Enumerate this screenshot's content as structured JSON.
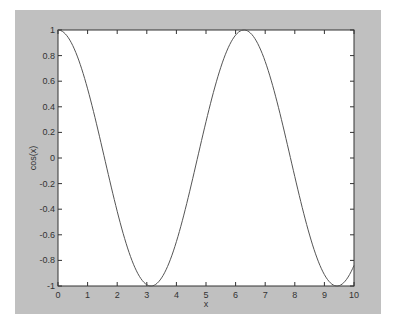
{
  "chart_data": {
    "type": "line",
    "title": "",
    "xlabel": "x",
    "ylabel": "cos(x)",
    "xlim": [
      0,
      10
    ],
    "ylim": [
      -1,
      1
    ],
    "grid": false,
    "legend": null,
    "x_ticks": [
      "0",
      "1",
      "2",
      "3",
      "4",
      "5",
      "6",
      "7",
      "8",
      "9",
      "10"
    ],
    "y_ticks": [
      "1",
      "0.8",
      "0.6",
      "0.4",
      "0.2",
      "0",
      "-0.2",
      "-0.4",
      "-0.6",
      "-0.8",
      "-1"
    ],
    "series": [
      {
        "name": "cos(x)",
        "color": "#555555",
        "x": [
          0,
          0.5,
          1,
          1.5,
          2,
          2.5,
          3,
          3.1416,
          3.5,
          4,
          4.5,
          5,
          5.5,
          6,
          6.2832,
          6.5,
          7,
          7.5,
          8,
          8.5,
          9,
          9.4248,
          9.5,
          10
        ],
        "y": [
          1,
          0.878,
          0.54,
          0.071,
          -0.416,
          -0.801,
          -0.99,
          -1,
          -0.936,
          -0.654,
          -0.211,
          0.284,
          0.709,
          0.96,
          1,
          0.977,
          0.754,
          0.347,
          -0.146,
          -0.602,
          -0.911,
          -1,
          -0.997,
          -0.839
        ]
      }
    ]
  },
  "colors": {
    "figure_bg": "#c0c0c0",
    "axes_bg": "#ffffff",
    "axis_color": "#333333",
    "line_color": "#555555"
  }
}
